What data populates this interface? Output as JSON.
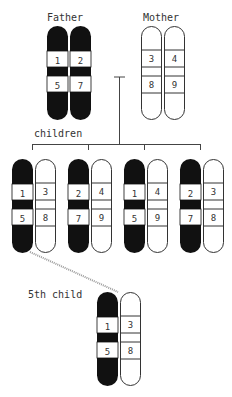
{
  "labels": {
    "father": "Father",
    "mother": "Mother",
    "children": "children",
    "fifth_child": "5th child"
  },
  "colors": {
    "dark_chromosome": "#111111",
    "light_chromosome": "#ffffff",
    "outline": "#333333",
    "connector_dotted": "#aaaaaa"
  },
  "parents": {
    "father": {
      "chromosomes": [
        {
          "genes": [
            "1",
            "5"
          ],
          "shade": "dark"
        },
        {
          "genes": [
            "2",
            "7"
          ],
          "shade": "dark"
        }
      ]
    },
    "mother": {
      "chromosomes": [
        {
          "genes": [
            "3",
            "8"
          ],
          "shade": "light"
        },
        {
          "genes": [
            "4",
            "9"
          ],
          "shade": "light"
        }
      ]
    }
  },
  "children": [
    {
      "dark": [
        "1",
        "5"
      ],
      "light": [
        "3",
        "8"
      ]
    },
    {
      "dark": [
        "2",
        "7"
      ],
      "light": [
        "4",
        "9"
      ]
    },
    {
      "dark": [
        "1",
        "5"
      ],
      "light": [
        "4",
        "9"
      ]
    },
    {
      "dark": [
        "2",
        "7"
      ],
      "light": [
        "3",
        "8"
      ]
    }
  ],
  "fifth_child": {
    "dark": [
      "1",
      "5"
    ],
    "light": [
      "3",
      "8"
    ]
  }
}
